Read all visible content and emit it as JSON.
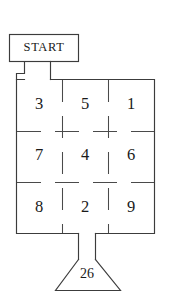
{
  "figure": {
    "type": "flow-diagram",
    "start_box": {
      "label": "START"
    },
    "grid": {
      "rows": [
        {
          "cells": [
            "3",
            "5",
            "1"
          ]
        },
        {
          "cells": [
            "7",
            "4",
            "6"
          ]
        },
        {
          "cells": [
            "8",
            "2",
            "9"
          ]
        }
      ],
      "row_count": 3,
      "column_count": 3,
      "internal_line_style": "dashed",
      "outer_line_style": "solid"
    },
    "funnel": {
      "label": "26",
      "shape": "trapezoid"
    },
    "colors": {
      "stroke": "#3c3c3c",
      "dashed_stroke": "#4a4a4a",
      "text": "#1a1a1a",
      "background": "#ffffff"
    }
  }
}
